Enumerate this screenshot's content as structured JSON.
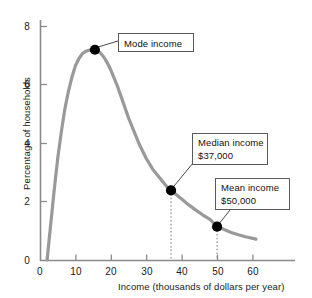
{
  "chart_data": {
    "type": "line",
    "title": "",
    "xlabel": "Income (thousands of dollars per year)",
    "ylabel": "Percentage of households",
    "xlim": [
      0,
      72
    ],
    "ylim": [
      0,
      8.8
    ],
    "xticks": [
      0,
      10,
      20,
      30,
      40,
      50,
      60
    ],
    "yticks": [
      0,
      2,
      4,
      6,
      8
    ],
    "grid": false,
    "legend": null,
    "series": [
      {
        "name": "Income distribution",
        "color": "#999999",
        "x": [
          2,
          3,
          4,
          5,
          6,
          7,
          8,
          9,
          10,
          11,
          12,
          13,
          14,
          15.5,
          17,
          18,
          19,
          20,
          21,
          22,
          23,
          24,
          25,
          26,
          27,
          28,
          30,
          32,
          34,
          36,
          37,
          38,
          40,
          42,
          44,
          46,
          48,
          50,
          52,
          54,
          56,
          58,
          61
        ],
        "y": [
          0,
          1.2,
          2.4,
          3.5,
          4.4,
          5.2,
          5.8,
          6.3,
          6.7,
          6.95,
          7.12,
          7.2,
          7.24,
          7.25,
          7.15,
          7.0,
          6.8,
          6.55,
          6.25,
          5.95,
          5.6,
          5.25,
          4.9,
          4.6,
          4.3,
          4.0,
          3.5,
          3.1,
          2.8,
          2.5,
          2.4,
          2.3,
          2.1,
          1.9,
          1.72,
          1.55,
          1.4,
          1.15,
          1.05,
          0.95,
          0.87,
          0.8,
          0.72
        ]
      }
    ],
    "points": [
      {
        "label": "Mode income",
        "value_label": "",
        "x": 15.5,
        "y": 7.25
      },
      {
        "label": "Median income",
        "value_label": "$37,000",
        "x": 37,
        "y": 2.4
      },
      {
        "label": "Mean income",
        "value_label": "$50,000",
        "x": 50,
        "y": 1.15
      }
    ],
    "annotations": [
      {
        "name": "mode-callout",
        "text": "Mode income",
        "text2": ""
      },
      {
        "name": "median-callout",
        "text": "Median income",
        "text2": "$37,000"
      },
      {
        "name": "mean-callout",
        "text": "Mean income",
        "text2": "$50,000"
      }
    ]
  },
  "axes": {
    "x_title": "Income (thousands of dollars per year)",
    "y_title": "Percentage of households",
    "x_tick_labels": [
      "0",
      "10",
      "20",
      "30",
      "40",
      "50",
      "60"
    ],
    "y_tick_labels": [
      "0",
      "2",
      "4",
      "6",
      "8"
    ]
  },
  "colors": {
    "curve": "#999999",
    "dot": "#000000",
    "axis": "#808080",
    "callout_border": "#5a5a5a",
    "text": "#111111",
    "background": "#ffffff"
  }
}
